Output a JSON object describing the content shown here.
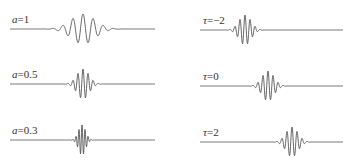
{
  "figure": {
    "line_color": "#555555",
    "left_column": {
      "title": "scale parameter",
      "panels": [
        {
          "param": "a",
          "value": "1",
          "label": "a=1",
          "baseline_y": 29,
          "center_x": 83,
          "width_sigma": 12,
          "freq": 0.62,
          "amp": 15
        },
        {
          "param": "a",
          "value": "0.5",
          "label": "a=0.5",
          "baseline_y": 84,
          "center_x": 83,
          "width_sigma": 6,
          "freq": 1.24,
          "amp": 15
        },
        {
          "param": "a",
          "value": "0.3",
          "label": "a=0.3",
          "baseline_y": 140,
          "center_x": 82,
          "width_sigma": 3.6,
          "freq": 2.07,
          "amp": 15
        }
      ],
      "x_start": 10,
      "x_end": 155
    },
    "right_column": {
      "title": "translation parameter",
      "panels": [
        {
          "param": "τ",
          "value": "-2",
          "label": "τ=-2",
          "baseline_y": 30,
          "center_x": 245,
          "width_sigma": 6,
          "freq": 1.24,
          "amp": 15
        },
        {
          "param": "τ",
          "value": "0",
          "label": "τ=0",
          "baseline_y": 86,
          "center_x": 268,
          "width_sigma": 6,
          "freq": 1.24,
          "amp": 15
        },
        {
          "param": "τ",
          "value": "2",
          "label": "τ=2",
          "baseline_y": 142,
          "center_x": 292,
          "width_sigma": 6,
          "freq": 1.24,
          "amp": 15
        }
      ],
      "x_start": 200,
      "x_end": 343
    },
    "labels": {
      "a1": {
        "var": "a",
        "eq": "=1"
      },
      "a05": {
        "var": "a",
        "eq": "=0.5"
      },
      "a03": {
        "var": "a",
        "eq": "=0.3"
      },
      "tm2": {
        "var": "τ",
        "eq": "=−2"
      },
      "t0": {
        "var": "τ",
        "eq": "=0"
      },
      "t2": {
        "var": "τ",
        "eq": "=2"
      }
    }
  }
}
